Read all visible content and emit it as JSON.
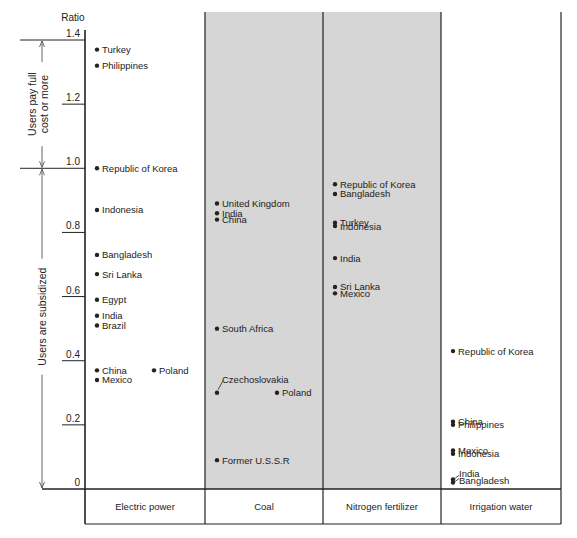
{
  "chart_data": {
    "type": "scatter",
    "title": "",
    "ylabel": "Ratio",
    "xlabel": "",
    "ylim": [
      0,
      1.4
    ],
    "yticks": [
      {
        "value": 1.4,
        "label": "1.4"
      },
      {
        "value": 1.2,
        "label": "1.2"
      },
      {
        "value": 1.0,
        "label": "1.0"
      },
      {
        "value": 0.8,
        "label": "0.8"
      },
      {
        "value": 0.6,
        "label": "0.6"
      },
      {
        "value": 0.4,
        "label": "0.4"
      },
      {
        "value": 0.2,
        "label": "0.2"
      },
      {
        "value": 0,
        "label": "0"
      }
    ],
    "grid": false,
    "annotations": {
      "upper_bracket": {
        "line1": "Users pay full",
        "line2": "cost or more",
        "from": 1.0,
        "to": 1.4
      },
      "lower_bracket": {
        "text": "Users are subsidized",
        "from": 0,
        "to": 1.0
      }
    },
    "categories": [
      "Electric power",
      "Coal",
      "Nitrogen fertilizer",
      "Irrigation water"
    ],
    "shaded_categories": [
      "Coal",
      "Nitrogen fertilizer"
    ],
    "series": [
      {
        "name": "Electric power",
        "points": [
          {
            "label": "Turkey",
            "value": 1.37
          },
          {
            "label": "Philippines",
            "value": 1.32
          },
          {
            "label": "Republic of Korea",
            "value": 1.0
          },
          {
            "label": "Indonesia",
            "value": 0.87
          },
          {
            "label": "Bangladesh",
            "value": 0.73
          },
          {
            "label": "Sri Lanka",
            "value": 0.67
          },
          {
            "label": "Egypt",
            "value": 0.59
          },
          {
            "label": "India",
            "value": 0.54
          },
          {
            "label": "Brazil",
            "value": 0.51
          },
          {
            "label": "China",
            "value": 0.37
          },
          {
            "label": "Mexico",
            "value": 0.34
          },
          {
            "label": "Poland",
            "value": 0.37,
            "offset": "right"
          }
        ]
      },
      {
        "name": "Coal",
        "points": [
          {
            "label": "United Kingdom",
            "value": 0.89
          },
          {
            "label": "India",
            "value": 0.86
          },
          {
            "label": "China",
            "value": 0.84
          },
          {
            "label": "South Africa",
            "value": 0.5
          },
          {
            "label": "Czechoslovakia",
            "value": 0.3,
            "leader": true
          },
          {
            "label": "Poland",
            "value": 0.3,
            "offset": "right"
          },
          {
            "label": "Former U.S.S.R",
            "value": 0.09
          }
        ]
      },
      {
        "name": "Nitrogen fertilizer",
        "points": [
          {
            "label": "Republic of Korea",
            "value": 0.95
          },
          {
            "label": "Bangladesh",
            "value": 0.92
          },
          {
            "label": "Turkey",
            "value": 0.83
          },
          {
            "label": "Indonesia",
            "value": 0.82
          },
          {
            "label": "India",
            "value": 0.72
          },
          {
            "label": "Sri Lanka",
            "value": 0.63
          },
          {
            "label": "Mexico",
            "value": 0.61
          }
        ]
      },
      {
        "name": "Irrigation water",
        "points": [
          {
            "label": "Republic of Korea",
            "value": 0.43
          },
          {
            "label": "China",
            "value": 0.21
          },
          {
            "label": "Philippines",
            "value": 0.2
          },
          {
            "label": "Mexico",
            "value": 0.12
          },
          {
            "label": "Indonesia",
            "value": 0.11
          },
          {
            "label": "India",
            "value": 0.03,
            "leader": true
          },
          {
            "label": "Bangladesh",
            "value": 0.02,
            "leader": true
          }
        ]
      }
    ]
  },
  "colors": {
    "shade": "#d6d6d6",
    "line": "#222222",
    "text": "#222222"
  }
}
